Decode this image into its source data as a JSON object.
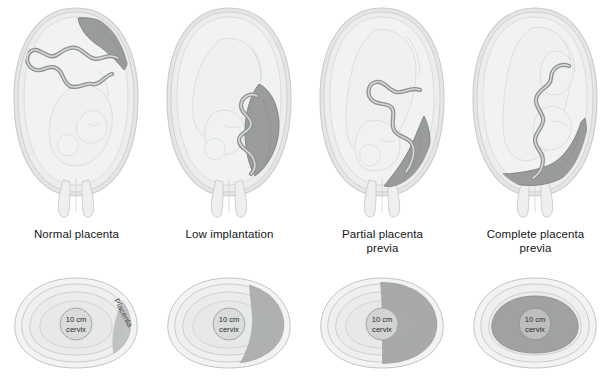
{
  "figure": {
    "background_color": "#ffffff"
  },
  "colors": {
    "uterus_wall_outer": "#d8d9d9",
    "uterus_wall_inner": "#e9eaea",
    "amniotic_fill": "#eeefef",
    "fetus_outline": "#d4d6d6",
    "placenta_fill": "#9a9c9c",
    "placenta_edge": "#7e8080",
    "cord_stroke": "#8f9192",
    "ring_stroke": "#c2c4c4",
    "cervix_circle_fill": "#dadbdb",
    "text": "#161616"
  },
  "panels": [
    {
      "id": "normal-placenta",
      "caption_lines": [
        "Normal placenta"
      ],
      "placenta_position": "fundal",
      "cervix_coverage": "none",
      "bottom": {
        "cervix_label_line1": "10 cm",
        "cervix_label_line2": "cervix",
        "placenta_label": "Placenta",
        "coverage_percent": 0
      }
    },
    {
      "id": "low-implantation",
      "caption_lines": [
        "Low implantation"
      ],
      "placenta_position": "lower-uterine-segment",
      "cervix_coverage": "none",
      "bottom": {
        "cervix_label_line1": "10 cm",
        "cervix_label_line2": "cervix",
        "placenta_label": "",
        "coverage_percent": 0
      }
    },
    {
      "id": "partial-placenta-previa",
      "caption_lines": [
        "Partial placenta",
        "previa"
      ],
      "placenta_position": "over-internal-os-partial",
      "cervix_coverage": "partial",
      "bottom": {
        "cervix_label_line1": "10 cm",
        "cervix_label_line2": "cervix",
        "placenta_label": "",
        "coverage_percent": 50
      }
    },
    {
      "id": "complete-placenta-previa",
      "caption_lines": [
        "Complete placenta",
        "previa"
      ],
      "placenta_position": "covering-internal-os",
      "cervix_coverage": "complete",
      "bottom": {
        "cervix_label_line1": "10 cm",
        "cervix_label_line2": "cervix",
        "placenta_label": "",
        "coverage_percent": 100
      }
    }
  ]
}
